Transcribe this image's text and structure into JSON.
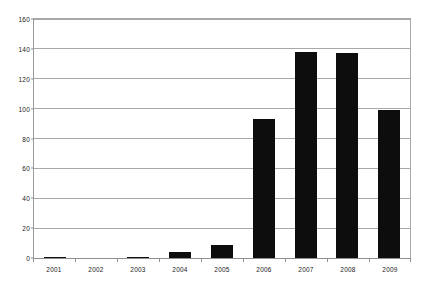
{
  "chart_data": {
    "type": "bar",
    "title": "",
    "subtitle": "",
    "xlabel": "",
    "ylabel": "",
    "categories": [
      "2001",
      "2002",
      "2003",
      "2004",
      "2005",
      "2006",
      "2007",
      "2008",
      "2009"
    ],
    "values": [
      1,
      0,
      1,
      4,
      9,
      93,
      138,
      137,
      99
    ],
    "series": [
      {
        "name": "",
        "values": [
          1,
          0,
          1,
          4,
          9,
          93,
          138,
          137,
          99
        ]
      }
    ],
    "ylim": [
      0,
      160
    ],
    "y_ticks": [
      0,
      20,
      40,
      60,
      80,
      100,
      120,
      140,
      160
    ],
    "y_tick_labels": [
      "0",
      "20",
      "40",
      "60",
      "80",
      "100",
      "120",
      "140",
      "160"
    ],
    "grid": true,
    "grid_axis": "y",
    "legend": false,
    "legend_position": "none",
    "annotations": [],
    "colors": {
      "bar": "#0d0d0d",
      "gridline": "#a8a8a8",
      "axis": "#8f8f8f",
      "background": "#ffffff",
      "text": "#1a1a1a"
    }
  }
}
